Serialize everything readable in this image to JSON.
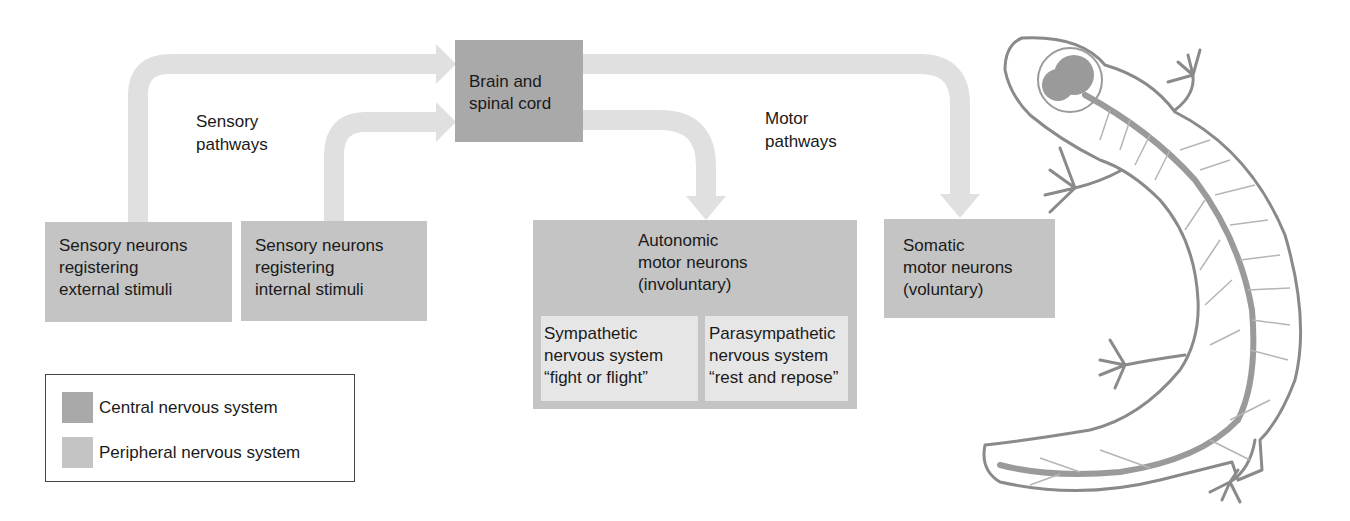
{
  "diagram": {
    "central": {
      "label_lines": [
        "Brain and",
        "spinal cord"
      ]
    },
    "sensory_pathways_label": [
      "Sensory",
      "pathways"
    ],
    "motor_pathways_label": [
      "Motor",
      "pathways"
    ],
    "sensory_external": {
      "label_lines": [
        "Sensory neurons",
        "registering",
        "external stimuli"
      ]
    },
    "sensory_internal": {
      "label_lines": [
        "Sensory neurons",
        "registering",
        "internal stimuli"
      ]
    },
    "autonomic": {
      "label_lines": [
        "Autonomic",
        "motor neurons",
        "(involuntary)"
      ],
      "sympathetic": {
        "label_lines": [
          "Sympathetic",
          "nervous system",
          "“fight or flight”"
        ]
      },
      "parasympathetic": {
        "label_lines": [
          "Parasympathetic",
          "nervous system",
          "“rest and repose”"
        ]
      }
    },
    "somatic": {
      "label_lines": [
        "Somatic",
        "motor neurons",
        "(voluntary)"
      ]
    },
    "illustration": {
      "subject": "salamander-nervous-system"
    }
  },
  "legend": {
    "items": [
      {
        "label": "Central nervous system",
        "color": "#a9a9a9"
      },
      {
        "label": "Peripheral nervous system",
        "color": "#c4c4c4"
      }
    ]
  },
  "colors": {
    "cns": "#a9a9a9",
    "pns": "#c4c4c4",
    "arrow": "#e0e0e0",
    "subdivision": "#e6e6e6"
  }
}
